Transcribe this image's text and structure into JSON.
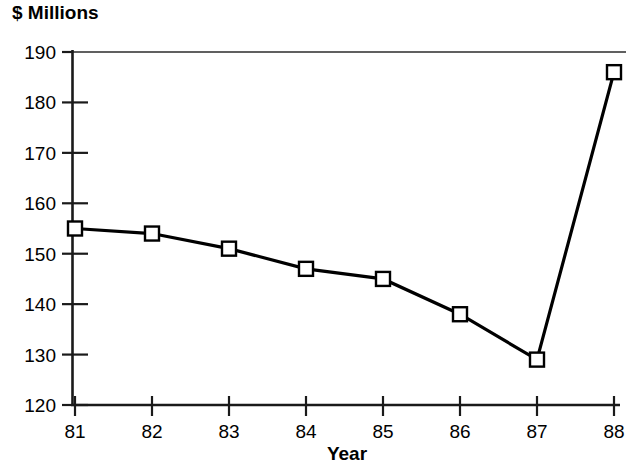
{
  "chart_data": {
    "type": "line",
    "title": "$ Millions",
    "xlabel": "Year",
    "ylabel": "$ Millions",
    "categories": [
      "81",
      "82",
      "83",
      "84",
      "85",
      "86",
      "87",
      "88"
    ],
    "x": [
      81,
      82,
      83,
      84,
      85,
      86,
      87,
      88
    ],
    "values": [
      155,
      154,
      151,
      147,
      145,
      138,
      129,
      186
    ],
    "series": [
      {
        "name": "$ Millions",
        "values": [
          155,
          154,
          151,
          147,
          145,
          138,
          129,
          186
        ],
        "marker": "open-square",
        "color": "#000000"
      }
    ],
    "ylim": [
      120,
      190
    ],
    "yticks": [
      120,
      130,
      140,
      150,
      160,
      170,
      180,
      190
    ],
    "ytick_labels": [
      "120",
      "130",
      "140",
      "150",
      "160",
      "170",
      "180",
      "190"
    ],
    "xticks": [
      81,
      82,
      83,
      84,
      85,
      86,
      87,
      88
    ],
    "xtick_labels": [
      "81",
      "82",
      "83",
      "84",
      "85",
      "86",
      "87",
      "88"
    ],
    "grid": false,
    "legend": null,
    "legend_position": "none",
    "annotations": []
  },
  "layout": {
    "plot_left": 72,
    "plot_right": 620,
    "plot_top": 52,
    "plot_bottom": 405,
    "x_first": 75,
    "x_step": 77,
    "y_per_unit": 5.043
  },
  "colors": {
    "line": "#000000",
    "marker_fill": "#ffffff",
    "axis": "#1a1a1a",
    "background": "#ffffff",
    "text": "#000000"
  }
}
